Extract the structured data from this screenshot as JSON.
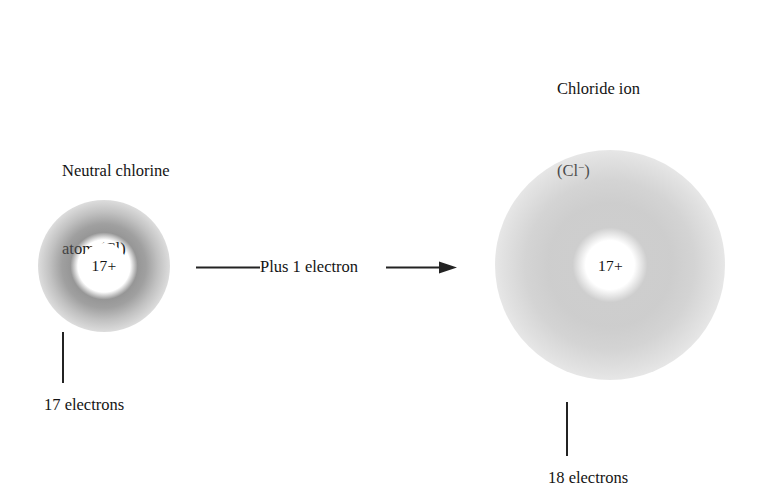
{
  "diagram": {
    "title_left": {
      "line1": "Neutral chlorine",
      "line2": "atom (Cl)"
    },
    "title_right": {
      "line1": "Chloride ion",
      "line2_prefix": "(Cl",
      "line2_charge": "−",
      "line2_suffix": ")"
    },
    "left_atom": {
      "nucleus_charge": "17+",
      "electron_count_label": "17 electrons"
    },
    "right_atom": {
      "nucleus_charge": "17+",
      "electron_count_label": "18 electrons"
    },
    "arrow": {
      "label": "Plus 1 electron"
    },
    "colors": {
      "background": "#ffffff",
      "text": "#141414",
      "line": "#232323",
      "cloud_left": "#565656",
      "cloud_right": "#8a8a8a",
      "nucleus_fill": "#ffffff"
    }
  }
}
